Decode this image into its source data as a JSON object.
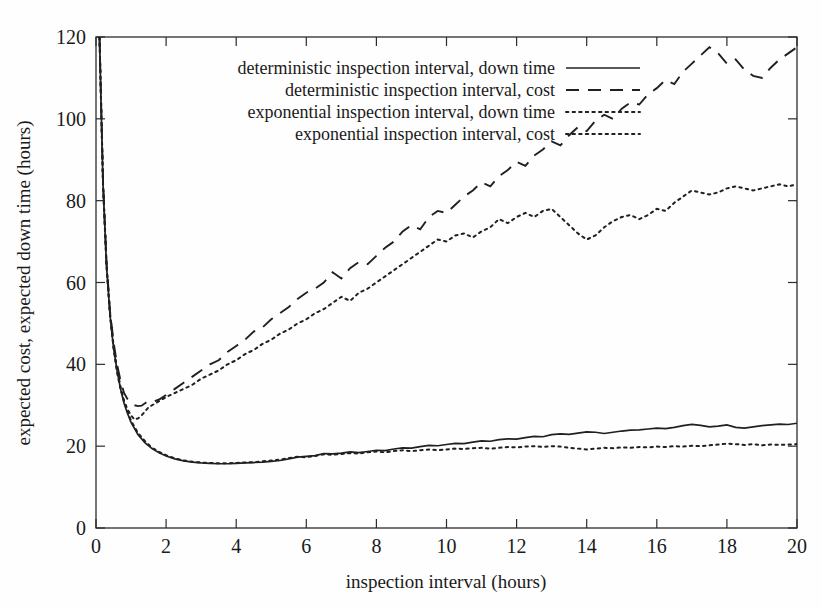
{
  "chart_data": {
    "type": "line",
    "title": "",
    "xlabel": "inspection interval (hours)",
    "ylabel": "expected cost, expected down time (hours)",
    "xlim": [
      0,
      20
    ],
    "ylim": [
      0,
      120
    ],
    "xticks": [
      0,
      2,
      4,
      6,
      8,
      10,
      12,
      14,
      16,
      18,
      20
    ],
    "xtick_labels": [
      "0",
      "2",
      "4",
      "6",
      "8",
      "10",
      "12",
      "14",
      "16",
      "18",
      "20"
    ],
    "yticks": [
      0,
      20,
      40,
      60,
      80,
      100,
      120
    ],
    "ytick_labels": [
      "0",
      "20",
      "40",
      "60",
      "80",
      "100",
      "120"
    ],
    "grid": false,
    "legend_position": "top-left-inside",
    "series": [
      {
        "name": "deterministic inspection interval, down time",
        "style": "solid",
        "x": [
          0.1,
          0.2,
          0.3,
          0.4,
          0.5,
          0.6,
          0.7,
          0.8,
          0.9,
          1.0,
          1.2,
          1.4,
          1.6,
          1.8,
          2.0,
          2.25,
          2.5,
          2.75,
          3.0,
          3.25,
          3.5,
          3.75,
          4.0,
          4.25,
          4.5,
          4.75,
          5.0,
          5.25,
          5.5,
          5.75,
          6.0,
          6.25,
          6.5,
          6.75,
          7.0,
          7.25,
          7.5,
          7.75,
          8.0,
          8.25,
          8.5,
          8.75,
          9.0,
          9.25,
          9.5,
          9.75,
          10.0,
          10.25,
          10.5,
          10.75,
          11.0,
          11.25,
          11.5,
          11.75,
          12.0,
          12.25,
          12.5,
          12.75,
          13.0,
          13.25,
          13.5,
          13.75,
          14.0,
          14.25,
          14.5,
          14.75,
          15.0,
          15.25,
          15.5,
          15.75,
          16.0,
          16.25,
          16.5,
          16.75,
          17.0,
          17.25,
          17.5,
          17.75,
          18.0,
          18.25,
          18.5,
          18.75,
          19.0,
          19.25,
          19.5,
          19.75,
          20.0
        ],
        "y": [
          120.0,
          84.0,
          64.0,
          52.0,
          44.0,
          38.5,
          34.0,
          30.5,
          28.0,
          25.8,
          22.8,
          20.8,
          19.4,
          18.4,
          17.6,
          16.9,
          16.4,
          16.1,
          15.9,
          15.8,
          15.7,
          15.7,
          15.8,
          15.9,
          16.0,
          16.1,
          16.3,
          16.5,
          16.9,
          17.3,
          17.5,
          17.7,
          18.2,
          18.1,
          18.3,
          18.6,
          18.4,
          18.7,
          19.0,
          18.9,
          19.3,
          19.6,
          19.5,
          19.9,
          20.2,
          20.1,
          20.4,
          20.7,
          20.6,
          21.0,
          21.3,
          21.2,
          21.6,
          21.8,
          21.7,
          22.1,
          22.4,
          22.3,
          22.8,
          23.0,
          22.9,
          23.2,
          23.5,
          23.4,
          23.1,
          23.4,
          23.7,
          23.9,
          24.0,
          24.2,
          24.4,
          24.3,
          24.6,
          25.0,
          25.3,
          25.1,
          24.7,
          24.9,
          25.2,
          24.6,
          24.4,
          24.7,
          25.0,
          25.2,
          25.4,
          25.3,
          25.6
        ]
      },
      {
        "name": "deterministic inspection interval, cost",
        "style": "dashed",
        "x": [
          0.1,
          0.2,
          0.3,
          0.4,
          0.5,
          0.6,
          0.7,
          0.8,
          0.9,
          1.0,
          1.1,
          1.2,
          1.3,
          1.4,
          1.5,
          1.6,
          1.8,
          2.0,
          2.25,
          2.5,
          2.75,
          3.0,
          3.25,
          3.5,
          3.75,
          4.0,
          4.25,
          4.5,
          4.75,
          5.0,
          5.25,
          5.5,
          5.75,
          6.0,
          6.25,
          6.5,
          6.75,
          7.0,
          7.25,
          7.5,
          7.75,
          8.0,
          8.25,
          8.5,
          8.75,
          9.0,
          9.25,
          9.5,
          9.75,
          10.0,
          10.25,
          10.5,
          10.75,
          11.0,
          11.25,
          11.5,
          11.75,
          12.0,
          12.25,
          12.5,
          12.75,
          13.0,
          13.25,
          13.5,
          13.75,
          14.0,
          14.25,
          14.5,
          14.75,
          15.0,
          15.25,
          15.5,
          15.75,
          16.0,
          16.25,
          16.5,
          16.75,
          17.0,
          17.25,
          17.5,
          17.75,
          18.0,
          18.25,
          18.5,
          18.75,
          19.0,
          19.25,
          19.5,
          19.75,
          20.0
        ],
        "y": [
          120.0,
          85.0,
          65.0,
          53.0,
          45.5,
          40.0,
          36.0,
          33.0,
          31.5,
          30.5,
          30.0,
          29.8,
          29.9,
          30.5,
          31.0,
          30.8,
          31.4,
          32.5,
          34.0,
          35.5,
          37.0,
          38.5,
          40.0,
          41.0,
          43.0,
          44.5,
          46.0,
          48.0,
          49.0,
          51.0,
          52.5,
          54.0,
          56.0,
          57.5,
          58.5,
          60.0,
          62.5,
          61.0,
          63.5,
          65.0,
          64.5,
          66.5,
          68.5,
          70.0,
          72.5,
          74.0,
          73.0,
          76.0,
          77.5,
          77.0,
          79.0,
          81.0,
          82.5,
          84.5,
          83.5,
          86.0,
          87.5,
          89.5,
          88.5,
          91.0,
          92.5,
          94.5,
          93.5,
          96.0,
          98.0,
          97.0,
          99.5,
          101.0,
          100.0,
          102.5,
          104.0,
          103.5,
          106.0,
          107.5,
          109.5,
          108.5,
          111.5,
          113.5,
          115.5,
          117.5,
          116.0,
          113.5,
          114.5,
          112.0,
          110.5,
          110.0,
          112.5,
          114.5,
          116.0,
          117.5
        ]
      },
      {
        "name": "exponential inspection interval, down time",
        "style": "dotted",
        "x": [
          0.1,
          0.2,
          0.3,
          0.4,
          0.5,
          0.6,
          0.7,
          0.8,
          0.9,
          1.0,
          1.2,
          1.4,
          1.6,
          1.8,
          2.0,
          2.25,
          2.5,
          2.75,
          3.0,
          3.25,
          3.5,
          3.75,
          4.0,
          4.25,
          4.5,
          4.75,
          5.0,
          5.25,
          5.5,
          5.75,
          6.0,
          6.25,
          6.5,
          6.75,
          7.0,
          7.25,
          7.5,
          7.75,
          8.0,
          8.25,
          8.5,
          8.75,
          9.0,
          9.25,
          9.5,
          9.75,
          10.0,
          10.25,
          10.5,
          10.75,
          11.0,
          11.25,
          11.5,
          11.75,
          12.0,
          12.25,
          12.5,
          12.75,
          13.0,
          13.25,
          13.5,
          13.75,
          14.0,
          14.25,
          14.5,
          14.75,
          15.0,
          15.25,
          15.5,
          15.75,
          16.0,
          16.25,
          16.5,
          16.75,
          17.0,
          17.25,
          17.5,
          17.75,
          18.0,
          18.25,
          18.5,
          18.75,
          19.0,
          19.25,
          19.5,
          19.75,
          20.0
        ],
        "y": [
          120.0,
          84.5,
          64.5,
          52.5,
          44.5,
          39.0,
          34.5,
          31.0,
          28.5,
          26.2,
          23.2,
          21.2,
          19.6,
          18.6,
          17.8,
          17.0,
          16.5,
          16.2,
          16.0,
          15.9,
          15.8,
          15.8,
          15.9,
          16.0,
          16.1,
          16.3,
          16.5,
          16.7,
          17.1,
          17.4,
          17.3,
          17.6,
          18.0,
          17.9,
          18.1,
          18.3,
          18.2,
          18.5,
          18.7,
          18.5,
          18.8,
          19.0,
          18.8,
          19.0,
          19.2,
          19.0,
          19.2,
          19.4,
          19.3,
          19.5,
          19.6,
          19.4,
          19.6,
          19.8,
          19.7,
          19.9,
          20.0,
          19.8,
          20.0,
          19.9,
          19.6,
          19.4,
          19.2,
          19.4,
          19.6,
          19.5,
          19.7,
          19.6,
          19.8,
          19.7,
          19.9,
          19.8,
          20.0,
          19.9,
          20.1,
          20.0,
          20.2,
          20.4,
          20.6,
          20.5,
          20.3,
          20.5,
          20.2,
          20.4,
          20.3,
          20.4,
          20.5
        ]
      },
      {
        "name": "exponential inspection interval, cost",
        "style": "fine-dotted",
        "x": [
          0.1,
          0.2,
          0.3,
          0.4,
          0.5,
          0.6,
          0.7,
          0.8,
          0.9,
          1.0,
          1.1,
          1.2,
          1.3,
          1.4,
          1.5,
          1.6,
          1.8,
          2.0,
          2.25,
          2.5,
          2.75,
          3.0,
          3.25,
          3.5,
          3.75,
          4.0,
          4.25,
          4.5,
          4.75,
          5.0,
          5.25,
          5.5,
          5.75,
          6.0,
          6.25,
          6.5,
          6.75,
          7.0,
          7.25,
          7.5,
          7.75,
          8.0,
          8.25,
          8.5,
          8.75,
          9.0,
          9.25,
          9.5,
          9.75,
          10.0,
          10.25,
          10.5,
          10.75,
          11.0,
          11.25,
          11.5,
          11.75,
          12.0,
          12.25,
          12.5,
          12.75,
          13.0,
          13.25,
          13.5,
          13.75,
          14.0,
          14.25,
          14.5,
          14.75,
          15.0,
          15.25,
          15.5,
          15.75,
          16.0,
          16.25,
          16.5,
          16.75,
          17.0,
          17.25,
          17.5,
          17.75,
          18.0,
          18.25,
          18.5,
          18.75,
          19.0,
          19.25,
          19.5,
          19.75,
          20.0
        ],
        "y": [
          120.0,
          84.0,
          64.0,
          52.0,
          44.0,
          38.0,
          34.0,
          31.0,
          29.0,
          27.5,
          26.5,
          26.8,
          27.5,
          28.5,
          29.5,
          30.0,
          31.0,
          32.0,
          33.0,
          34.0,
          35.0,
          36.5,
          37.5,
          38.5,
          40.0,
          41.0,
          42.5,
          43.5,
          45.0,
          46.0,
          47.5,
          48.5,
          50.0,
          51.0,
          52.5,
          53.5,
          55.0,
          56.5,
          55.5,
          57.5,
          58.5,
          60.0,
          61.5,
          63.0,
          64.5,
          66.0,
          67.5,
          69.0,
          70.5,
          70.0,
          71.5,
          72.0,
          71.0,
          72.5,
          73.5,
          75.5,
          74.5,
          76.0,
          77.0,
          76.0,
          77.5,
          78.0,
          76.0,
          74.0,
          72.0,
          70.5,
          71.5,
          73.5,
          75.0,
          76.0,
          76.5,
          75.5,
          76.5,
          78.0,
          77.5,
          79.5,
          81.0,
          82.5,
          82.0,
          81.5,
          82.0,
          83.0,
          83.5,
          83.0,
          82.5,
          83.0,
          83.5,
          84.0,
          83.5,
          84.0
        ]
      }
    ]
  },
  "legend": {
    "entries": [
      {
        "label": "deterministic inspection interval, down time",
        "style": "solid"
      },
      {
        "label": "deterministic inspection interval, cost",
        "style": "dashed"
      },
      {
        "label": "exponential inspection interval, down time",
        "style": "dotted"
      },
      {
        "label": "exponential inspection interval, cost",
        "style": "fine-dotted"
      }
    ]
  },
  "colors": {
    "ink": "#202020",
    "background": "#fefefe"
  }
}
